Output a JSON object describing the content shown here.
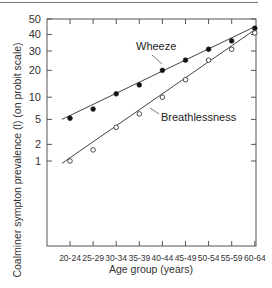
{
  "chart_data": {
    "type": "line",
    "title": "",
    "xlabel": "Age group (years)",
    "ylabel": "Coalminer sympton prevalence (l) (on probit scale)",
    "y_scale": "probit",
    "ylim": [
      1,
      50
    ],
    "y_ticks": [
      1,
      2,
      5,
      10,
      20,
      30,
      40,
      50
    ],
    "categories": [
      "20-24",
      "25-29",
      "30-34",
      "35-39",
      "40-44",
      "45-49",
      "50-54",
      "55-59",
      "60-64"
    ],
    "series": [
      {
        "name": "Wheeze",
        "marker": "filled-circle",
        "values": [
          5.2,
          7,
          11,
          14,
          20,
          25,
          31,
          36,
          44
        ],
        "fit_line": {
          "start": 5,
          "end": 45
        }
      },
      {
        "name": "Breathlessness",
        "marker": "open-circle",
        "values": [
          1,
          1.6,
          3.8,
          6,
          10,
          16,
          25,
          31,
          41
        ],
        "fit_line": {
          "start": 0.9,
          "end": 43
        }
      }
    ],
    "grid": false,
    "legend": "inline labels"
  },
  "labels": {
    "wheeze": "Wheeze",
    "breathlessness": "Breathlessness",
    "xlabel": "Age group (years)",
    "ylabel": "Coalminer sympton prevalence (l) (on probit scale)"
  }
}
